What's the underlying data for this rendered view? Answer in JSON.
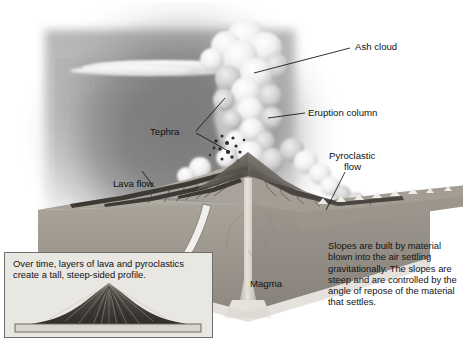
{
  "figure": {
    "type": "illustration",
    "palette": {
      "background": "#ffffff",
      "ash_cloud": "#6c6c6c",
      "plume": "#f2f2f2",
      "land_top": "#b9b4ab",
      "land_front": "#a09a91",
      "land_side": "#8e8880",
      "magma": "#d8d4cc",
      "inset_bg": "#e9e7e2",
      "inset_border": "#6f6f6f",
      "text": "#111111",
      "leader_line": "#1a1a1a"
    }
  },
  "labels": [
    {
      "id": "ash-cloud",
      "text": "Ash cloud"
    },
    {
      "id": "eruption-column",
      "text": "Eruption column"
    },
    {
      "id": "tephra",
      "text": "Tephra"
    },
    {
      "id": "pyroclastic-flow",
      "text": "Pyroclastic\nflow"
    },
    {
      "id": "pyroclastic-flow-line1",
      "text": "Pyroclastic"
    },
    {
      "id": "pyroclastic-flow-line2",
      "text": "flow"
    },
    {
      "id": "lava-flow",
      "text": "Lava flow"
    },
    {
      "id": "magma",
      "text": "Magma"
    }
  ],
  "annotations": {
    "slopes_note": "Slopes are built by material blown into the air settling gravitationally. The slopes are steep and are controlled by the angle of repose of the material that settles.",
    "inset_caption": "Over time, layers of lava and pyroclastics create a tall, steep-sided profile."
  },
  "inset": {
    "caption": "Over time, layers of lava and pyroclastics create a tall, steep-sided profile.",
    "contains": "profile-silhouette-of-composite-volcano"
  }
}
